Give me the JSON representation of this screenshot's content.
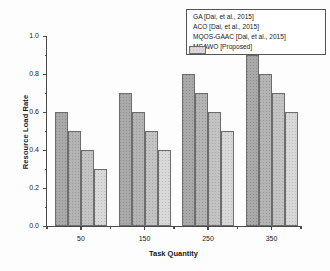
{
  "chart_data": {
    "type": "bar",
    "title": "",
    "xlabel": "Task Quantity",
    "ylabel": "Resource Load Rate",
    "categories": [
      "50",
      "150",
      "250",
      "350"
    ],
    "ylim": [
      0.0,
      1.0
    ],
    "yticks": [
      "0.0",
      "0.2",
      "0.4",
      "0.6",
      "0.8",
      "1.0"
    ],
    "ytick_values": [
      0.0,
      0.2,
      0.4,
      0.6,
      0.8,
      1.0
    ],
    "grid": false,
    "legend_position": "top-right",
    "series": [
      {
        "name": "GA [Dai, et al., 2015]",
        "color": "#a9a9a9",
        "values": [
          0.6,
          0.7,
          0.8,
          0.9
        ]
      },
      {
        "name": "ACO  [Dai, et al., 2015]",
        "color": "#b4b4b4",
        "values": [
          0.5,
          0.6,
          0.7,
          0.8
        ]
      },
      {
        "name": "MQOS-GAAC [Dai, et al., 2015]",
        "color": "#c3c3c3",
        "values": [
          0.4,
          0.5,
          0.6,
          0.7
        ]
      },
      {
        "name": "MSAWO [Proposed]",
        "color": "#d8d8d8",
        "values": [
          0.3,
          0.4,
          0.5,
          0.6
        ]
      }
    ]
  }
}
